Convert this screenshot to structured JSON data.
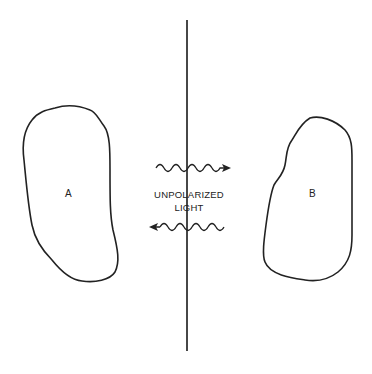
{
  "diagram": {
    "regions": [
      {
        "id": "A",
        "label": "A"
      },
      {
        "id": "B",
        "label": "B"
      }
    ],
    "center_label": {
      "line1": "UNPOLARIZED",
      "line2": "LIGHT"
    },
    "waves": [
      {
        "direction": "right",
        "position": "top"
      },
      {
        "direction": "left",
        "position": "bottom"
      }
    ],
    "colors": {
      "stroke": "#222222",
      "background": "#ffffff"
    }
  }
}
